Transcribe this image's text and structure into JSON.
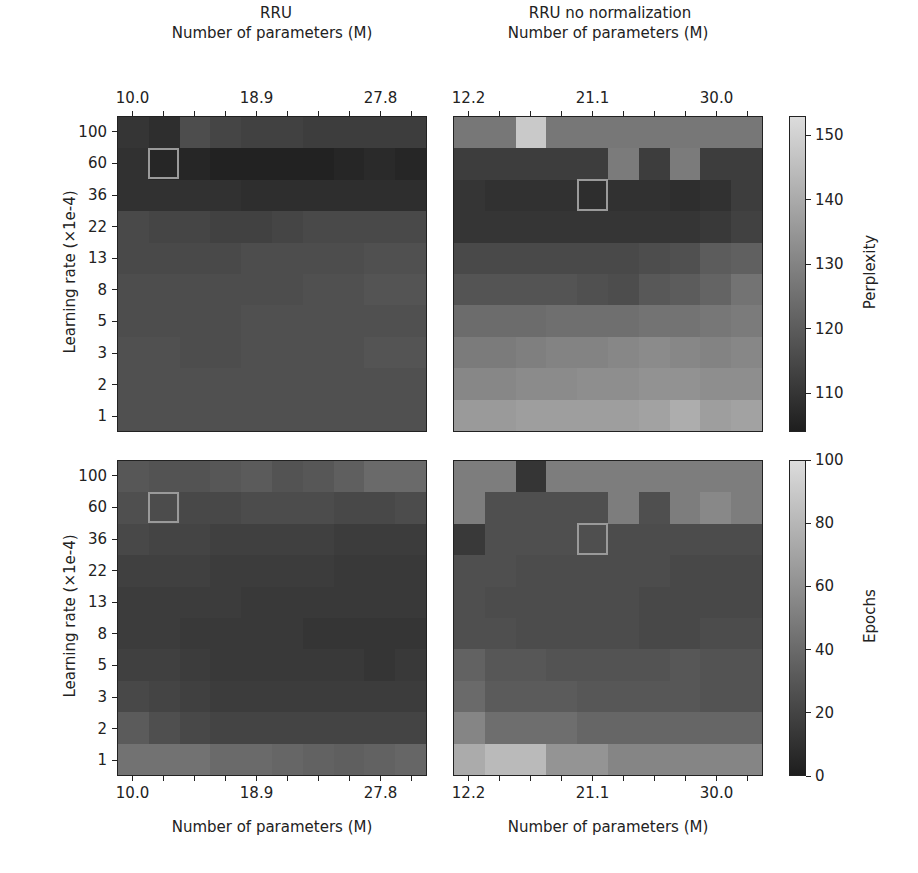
{
  "chart_data": [
    {
      "type": "heatmap",
      "panel": "top-left",
      "title": "RRU",
      "xlabel": "Number of parameters (M)",
      "ylabel": "Learning rate (×1e-4)",
      "x_tick_labels": [
        "10.0",
        "18.9",
        "27.8"
      ],
      "y_tick_labels": [
        "100",
        "60",
        "36",
        "22",
        "13",
        "8",
        "5",
        "3",
        "2",
        "1"
      ],
      "metric": "Perplexity",
      "highlight": {
        "row": 1,
        "col": 1
      },
      "values": [
        [
          110,
          108,
          116,
          114,
          113,
          113,
          112,
          112,
          112,
          112
        ],
        [
          109,
          106,
          106,
          105,
          105,
          105,
          105,
          106,
          107,
          106
        ],
        [
          109,
          109,
          109,
          109,
          108,
          108,
          108,
          108,
          108,
          108
        ],
        [
          115,
          114,
          114,
          113,
          113,
          114,
          115,
          115,
          115,
          115
        ],
        [
          115,
          115,
          115,
          115,
          116,
          116,
          116,
          116,
          117,
          117
        ],
        [
          116,
          116,
          116,
          116,
          116,
          116,
          117,
          117,
          118,
          118
        ],
        [
          116,
          116,
          116,
          116,
          117,
          117,
          117,
          117,
          117,
          117
        ],
        [
          117,
          117,
          116,
          116,
          117,
          117,
          117,
          117,
          118,
          118
        ],
        [
          117,
          117,
          117,
          117,
          117,
          117,
          117,
          117,
          117,
          117
        ],
        [
          117,
          117,
          117,
          117,
          117,
          117,
          117,
          117,
          117,
          117
        ]
      ]
    },
    {
      "type": "heatmap",
      "panel": "top-right",
      "title": "RRU no normalization",
      "xlabel": "Number of parameters (M)",
      "ylabel": "",
      "x_tick_labels": [
        "12.2",
        "21.1",
        "30.0"
      ],
      "y_tick_labels": [
        "100",
        "60",
        "36",
        "22",
        "13",
        "8",
        "5",
        "3",
        "2",
        "1"
      ],
      "metric": "Perplexity",
      "highlight": {
        "row": 2,
        "col": 4
      },
      "values": [
        [
          127,
          127,
          148,
          127,
          127,
          127,
          127,
          127,
          127,
          127
        ],
        [
          112,
          112,
          112,
          112,
          112,
          128,
          112,
          128,
          112,
          112
        ],
        [
          110,
          109,
          109,
          109,
          108,
          109,
          109,
          108,
          109,
          112
        ],
        [
          110,
          110,
          110,
          110,
          110,
          110,
          110,
          110,
          111,
          113
        ],
        [
          115,
          115,
          115,
          115,
          115,
          115,
          116,
          117,
          120,
          121
        ],
        [
          118,
          118,
          118,
          118,
          117,
          116,
          119,
          120,
          122,
          126
        ],
        [
          124,
          124,
          124,
          125,
          125,
          125,
          126,
          126,
          127,
          128
        ],
        [
          128,
          128,
          129,
          130,
          130,
          131,
          132,
          131,
          130,
          131
        ],
        [
          131,
          131,
          132,
          132,
          133,
          133,
          134,
          134,
          133,
          133
        ],
        [
          136,
          136,
          137,
          137,
          137,
          137,
          138,
          141,
          137,
          138
        ]
      ]
    },
    {
      "type": "heatmap",
      "panel": "bottom-left",
      "title": "",
      "xlabel": "Number of parameters (M)",
      "ylabel": "Learning rate (×1e-4)",
      "x_tick_labels": [
        "10.0",
        "18.9",
        "27.8"
      ],
      "y_tick_labels": [
        "100",
        "60",
        "36",
        "22",
        "13",
        "8",
        "5",
        "3",
        "2",
        "1"
      ],
      "metric": "Epochs",
      "highlight": {
        "row": 1,
        "col": 1
      },
      "values": [
        [
          30,
          28,
          28,
          30,
          32,
          28,
          30,
          34,
          40,
          40
        ],
        [
          26,
          24,
          22,
          22,
          24,
          24,
          24,
          22,
          22,
          24
        ],
        [
          22,
          20,
          20,
          18,
          18,
          18,
          18,
          16,
          16,
          16
        ],
        [
          18,
          18,
          18,
          16,
          16,
          16,
          16,
          14,
          14,
          14
        ],
        [
          16,
          16,
          16,
          16,
          14,
          14,
          14,
          14,
          14,
          14
        ],
        [
          16,
          16,
          14,
          14,
          14,
          14,
          12,
          12,
          12,
          12
        ],
        [
          18,
          18,
          16,
          14,
          14,
          14,
          14,
          14,
          12,
          14
        ],
        [
          22,
          20,
          18,
          16,
          16,
          16,
          16,
          16,
          16,
          16
        ],
        [
          32,
          26,
          22,
          20,
          20,
          20,
          20,
          20,
          20,
          20
        ],
        [
          44,
          44,
          44,
          40,
          40,
          38,
          36,
          34,
          36,
          38
        ]
      ]
    },
    {
      "type": "heatmap",
      "panel": "bottom-right",
      "title": "",
      "xlabel": "Number of parameters (M)",
      "ylabel": "",
      "x_tick_labels": [
        "12.2",
        "21.1",
        "30.0"
      ],
      "y_tick_labels": [
        "100",
        "60",
        "36",
        "22",
        "13",
        "8",
        "5",
        "3",
        "2",
        "1"
      ],
      "metric": "Epochs",
      "highlight": {
        "row": 2,
        "col": 4
      },
      "values": [
        [
          50,
          50,
          12,
          50,
          50,
          50,
          50,
          50,
          50,
          50
        ],
        [
          50,
          26,
          26,
          26,
          26,
          50,
          26,
          50,
          56,
          50
        ],
        [
          14,
          26,
          26,
          26,
          26,
          24,
          24,
          24,
          24,
          24
        ],
        [
          26,
          26,
          24,
          24,
          24,
          24,
          24,
          22,
          22,
          22
        ],
        [
          26,
          24,
          24,
          24,
          24,
          24,
          22,
          22,
          22,
          22
        ],
        [
          26,
          26,
          24,
          24,
          24,
          24,
          22,
          22,
          24,
          24
        ],
        [
          36,
          30,
          30,
          28,
          28,
          28,
          28,
          30,
          28,
          28
        ],
        [
          40,
          32,
          32,
          32,
          30,
          30,
          30,
          30,
          28,
          28
        ],
        [
          54,
          42,
          42,
          42,
          38,
          38,
          38,
          38,
          38,
          38
        ],
        [
          74,
          82,
          82,
          62,
          62,
          54,
          54,
          54,
          54,
          54
        ]
      ]
    }
  ],
  "colorbars": [
    {
      "label": "Perplexity",
      "ticks": [
        "150",
        "140",
        "130",
        "120",
        "110"
      ],
      "min": 104,
      "max": 153
    },
    {
      "label": "Epochs",
      "ticks": [
        "100",
        "80",
        "60",
        "40",
        "20",
        "0"
      ],
      "min": 0,
      "max": 100
    }
  ],
  "colors": {
    "cmap_low": "#1e1e1e",
    "cmap_high": "#dcdcdc",
    "highlight_box": "#9a9a9a"
  }
}
